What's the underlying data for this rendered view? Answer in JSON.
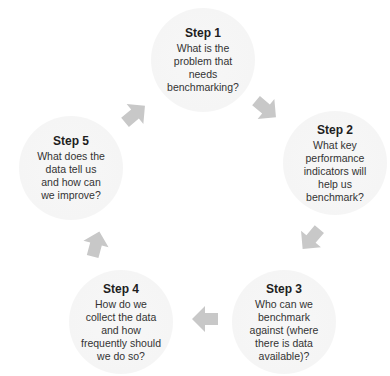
{
  "diagram": {
    "type": "cycle",
    "steps": [
      {
        "title": "Step 1",
        "body": "What is the\nproblem that\nneeds\nbenchmarking?"
      },
      {
        "title": "Step 2",
        "body": "What key\nperformance\nindicators will\nhelp us\nbenchmark?"
      },
      {
        "title": "Step 3",
        "body": "Who can we\nbenchmark\nagainst (where\nthere is data\navailable)?"
      },
      {
        "title": "Step 4",
        "body": "How do we\ncollect the data\nand how\nfrequently should\nwe do so?"
      },
      {
        "title": "Step 5",
        "body": "What does the\ndata tell us\nand how can\nwe improve?"
      }
    ],
    "arrows": [
      {
        "from": "Step 1",
        "to": "Step 2",
        "direction": "down-right"
      },
      {
        "from": "Step 2",
        "to": "Step 3",
        "direction": "down-left"
      },
      {
        "from": "Step 3",
        "to": "Step 4",
        "direction": "left"
      },
      {
        "from": "Step 4",
        "to": "Step 5",
        "direction": "up"
      },
      {
        "from": "Step 5",
        "to": "Step 1",
        "direction": "up-right"
      }
    ],
    "colors": {
      "arrow": "#c8c8c8",
      "circle": "#f5f5f5",
      "text": "#2a2a2a"
    }
  }
}
